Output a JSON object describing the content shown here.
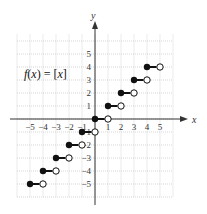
{
  "chart_data": {
    "type": "line",
    "subtype": "step",
    "title": "",
    "annotation": "f(x) = [x]",
    "annotation_parts": {
      "f": "f",
      "open": "(",
      "x": "x",
      "close": ") = [",
      "x2": "x",
      "end": "]"
    },
    "xlabel": "x",
    "ylabel": "y",
    "xlim": [
      -5.5,
      5.5
    ],
    "ylim": [
      -5.5,
      5.5
    ],
    "grid": true,
    "legend": "none",
    "x_ticks": [
      "−5",
      "−4",
      "−3",
      "−2",
      "−1",
      "1",
      "2",
      "3",
      "4",
      "5"
    ],
    "y_ticks": [
      "5",
      "4",
      "3",
      "2",
      "1",
      "−1",
      "−2",
      "−3",
      "−4",
      "−5"
    ],
    "segments": [
      {
        "x_start": -5,
        "x_end": -4,
        "y": -5,
        "closed_start": true,
        "open_end": true
      },
      {
        "x_start": -4,
        "x_end": -3,
        "y": -4,
        "closed_start": true,
        "open_end": true
      },
      {
        "x_start": -3,
        "x_end": -2,
        "y": -3,
        "closed_start": true,
        "open_end": true
      },
      {
        "x_start": -2,
        "x_end": -1,
        "y": -2,
        "closed_start": true,
        "open_end": true
      },
      {
        "x_start": -1,
        "x_end": 0,
        "y": -1,
        "closed_start": true,
        "open_end": true
      },
      {
        "x_start": 0,
        "x_end": 1,
        "y": 0,
        "closed_start": true,
        "open_end": true
      },
      {
        "x_start": 1,
        "x_end": 2,
        "y": 1,
        "closed_start": true,
        "open_end": true
      },
      {
        "x_start": 2,
        "x_end": 3,
        "y": 2,
        "closed_start": true,
        "open_end": true
      },
      {
        "x_start": 3,
        "x_end": 4,
        "y": 3,
        "closed_start": true,
        "open_end": true
      },
      {
        "x_start": 4,
        "x_end": 5,
        "y": 4,
        "closed_start": true,
        "open_end": true
      }
    ]
  }
}
